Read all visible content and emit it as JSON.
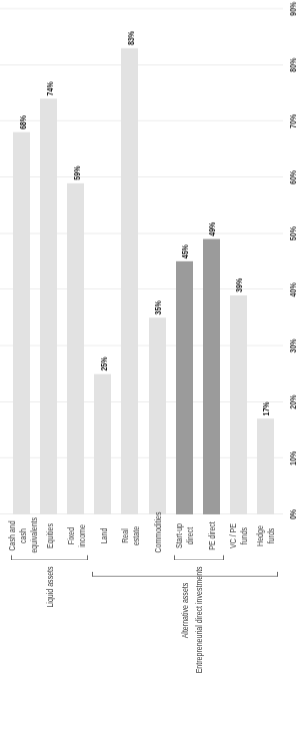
{
  "chart_data": {
    "type": "bar",
    "orientation": "horizontal",
    "title": "",
    "subtitle": "",
    "xlabel": "",
    "ylabel": "",
    "ylim": [
      0,
      90
    ],
    "grid": true,
    "legend": "none",
    "tick_labels": [
      "0%",
      "10%",
      "20%",
      "30%",
      "40%",
      "50%",
      "60%",
      "70%",
      "80%",
      "90%"
    ],
    "tick_values": [
      0,
      10,
      20,
      30,
      40,
      50,
      60,
      70,
      80,
      90
    ],
    "categories": [
      "Cash and cash\nequivalents",
      "Equities",
      "Fixed income",
      "Land",
      "Real estate",
      "Commodities",
      "Start-up direct",
      "PE direct",
      "VC / PE funds",
      "Hedge furds"
    ],
    "values": [
      68,
      74,
      59,
      25,
      83,
      35,
      45,
      49,
      39,
      17
    ],
    "data_labels": [
      "68%",
      "74%",
      "59%",
      "25%",
      "83%",
      "35%",
      "45%",
      "49%",
      "39%",
      "17%"
    ],
    "highlighted": [
      false,
      false,
      false,
      false,
      false,
      false,
      true,
      true,
      false,
      false
    ],
    "colors": {
      "bar_default": "#e2e2e2",
      "bar_highlight": "#9b9b9b",
      "grid": "#e6e6e6",
      "text": "#3a3a3a",
      "bracket": "#6a6a6a"
    },
    "groups": [
      {
        "label": "Liquid assets",
        "from": "Cash and cash equivalents",
        "to": "Fixed income"
      },
      {
        "label": "Entrepreneurial direct investments",
        "from": "Start-up direct",
        "to": "PE direct"
      },
      {
        "label": "Alternative assets",
        "from": "Land",
        "to": "Hedge furds"
      }
    ]
  }
}
